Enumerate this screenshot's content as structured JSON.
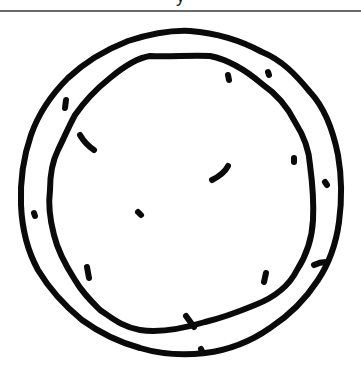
{
  "header": {
    "caption_partial": "y"
  },
  "drawing": {
    "subject": "pizza-crust-sketch",
    "stroke_color": "#0a0a0a",
    "background": "#ffffff",
    "divider_color": "#6b6b6b"
  }
}
